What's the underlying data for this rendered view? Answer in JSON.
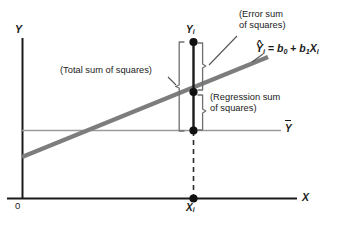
{
  "figure": {
    "type": "regression-decomposition-diagram",
    "background": "#ffffff",
    "axes": {
      "y_label": "Y",
      "x_label": "X",
      "origin_label": "0",
      "axis_color": "#1a1a1a"
    },
    "annotations": {
      "error_sum": "(Error sum\nof squares)",
      "error_sum_line1": "(Error sum",
      "error_sum_line2": "of squares)",
      "total_sum": "(Total sum of squares)",
      "regression_sum_line1": "(Regression sum",
      "regression_sum_line2": "of squares)"
    },
    "equation": {
      "lhs_var": "Y",
      "lhs_hat": "^",
      "lhs_sub": "i",
      "equals": "=",
      "b0": "b",
      "b0_sub": "0",
      "plus": "+",
      "b1": "b",
      "b1_sub": "1",
      "x": "X",
      "x_sub": "i",
      "full_text": "Yi = b0 + b1Xi"
    },
    "point_labels": {
      "y_i": "Y",
      "y_i_sub": "i",
      "x_i": "X",
      "x_i_sub": "i",
      "y_bar": "Y"
    },
    "colors": {
      "regression_line": "#7a7a7a",
      "mean_line": "#999999",
      "axis": "#1a1a1a",
      "dot": "#111111",
      "bracket": "#6f6f6f",
      "dashed": "#333333",
      "text": "#1a1a1a"
    },
    "geometry": {
      "y_axis_x": 22,
      "x_axis_y": 198,
      "vertical_line_x": 193,
      "y_i_y": 42,
      "y_hat_y": 92,
      "y_bar_y": 130,
      "mean_line_y": 130,
      "regression_left_y": 156,
      "regression_right_y": 58
    }
  }
}
